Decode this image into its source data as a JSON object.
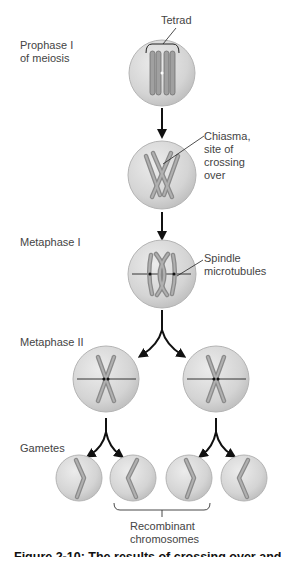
{
  "stages": {
    "prophase": "Prophase I\nof meiosis",
    "metaphase1": "Metaphase I",
    "metaphase2": "Metaphase II",
    "gametes": "Gametes"
  },
  "annotations": {
    "tetrad": "Tetrad",
    "chiasma": "Chiasma,\nsite of\ncrossing\nover",
    "spindle": "Spindle\nmicrotubules",
    "recombinant": "Recombinant\nchromosomes"
  },
  "caption": "Figure 2-10: The results of crossing over and",
  "colors": {
    "cell_fill": "#d6d6d6",
    "cell_edge": "#b4b4b4",
    "chromosome": "#9a9a9a",
    "chromosome_edge": "#6e6e6e",
    "arrow": "#111111"
  }
}
